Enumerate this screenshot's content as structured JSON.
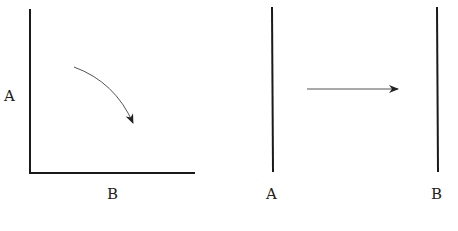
{
  "left_diagram": {
    "y_axis_label": "A",
    "x_axis_label": "B",
    "arrow": "curved-arrow-down-right"
  },
  "right_diagram": {
    "left_line_label": "A",
    "right_line_label": "B",
    "arrow": "straight-arrow-right"
  },
  "colors": {
    "line": "#1a1a1a",
    "arrow": "#333333",
    "background": "#ffffff"
  }
}
